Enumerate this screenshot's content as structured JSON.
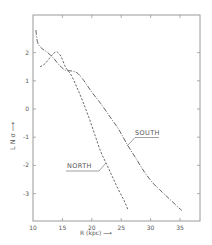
{
  "chart_data": {
    "type": "line",
    "title": "",
    "xlabel": "R (kpc) ⟶",
    "ylabel": "L N σ ⟶",
    "xlim": [
      10,
      38.4
    ],
    "ylim": [
      -4.0,
      3.33
    ],
    "x_ticks": [
      10,
      15,
      20,
      25,
      30,
      35
    ],
    "y_ticks": [
      2,
      1,
      0,
      -1,
      -2,
      -3
    ],
    "x_tick_labels": [
      "10",
      "15",
      "20",
      "25",
      "30",
      "35"
    ],
    "y_tick_labels": [
      "2",
      "1",
      "0",
      "-1",
      "-2",
      "-3"
    ],
    "grid": false,
    "legend": "inline labels with leader lines",
    "series": [
      {
        "name": "SOUTH",
        "style": "dash-dot",
        "points": [
          [
            10.5,
            2.8
          ],
          [
            10.8,
            2.35
          ],
          [
            11.5,
            2.15
          ],
          [
            12.5,
            2.0
          ],
          [
            13.5,
            1.8
          ],
          [
            14.5,
            1.55
          ],
          [
            15.5,
            1.38
          ],
          [
            16.5,
            1.35
          ],
          [
            17.5,
            1.28
          ],
          [
            18.5,
            1.05
          ],
          [
            20.0,
            0.6
          ],
          [
            21.5,
            0.2
          ],
          [
            23.0,
            -0.25
          ],
          [
            24.5,
            -0.7
          ],
          [
            26.0,
            -1.25
          ],
          [
            27.5,
            -1.75
          ],
          [
            29.0,
            -2.25
          ],
          [
            30.5,
            -2.65
          ],
          [
            32.0,
            -2.95
          ],
          [
            33.5,
            -3.25
          ],
          [
            35.3,
            -3.6
          ]
        ]
      },
      {
        "name": "NORTH",
        "style": "dashed",
        "points": [
          [
            11.2,
            1.5
          ],
          [
            12.0,
            1.6
          ],
          [
            12.8,
            1.8
          ],
          [
            13.5,
            1.97
          ],
          [
            14.1,
            2.02
          ],
          [
            14.8,
            1.85
          ],
          [
            15.5,
            1.5
          ],
          [
            16.5,
            1.2
          ],
          [
            17.5,
            0.75
          ],
          [
            18.5,
            0.25
          ],
          [
            19.5,
            -0.3
          ],
          [
            20.5,
            -0.9
          ],
          [
            21.5,
            -1.5
          ],
          [
            22.5,
            -1.95
          ],
          [
            23.5,
            -2.4
          ],
          [
            24.5,
            -2.85
          ],
          [
            25.5,
            -3.25
          ],
          [
            26.2,
            -3.6
          ]
        ]
      }
    ],
    "annotations": [
      {
        "text": "SOUTH",
        "x": 27.5,
        "y": -0.9,
        "points_to": [
          26.0,
          -1.25
        ]
      },
      {
        "text": "NORTH",
        "x": 16.5,
        "y": -2.0,
        "points_to": [
          22.6,
          -1.9
        ]
      }
    ]
  }
}
